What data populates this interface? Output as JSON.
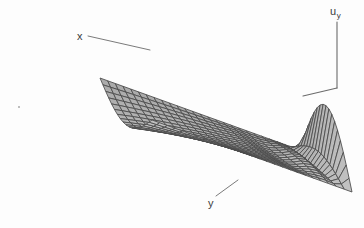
{
  "figure": {
    "kind": "surface-mesh-plot",
    "caption_labels": {
      "x_axis": "x",
      "y_axis": "y",
      "vertical_axis_base": "u",
      "vertical_axis_sub": "y"
    },
    "background_color": "#fdfdfd",
    "mesh_line_color": "#4a4a4a",
    "surface_fill_light": "#c2c2c2",
    "surface_fill_dark": "#8f8f8f",
    "axis_line_color": "#6b6b6b",
    "label_color": "#3b3b3b"
  },
  "chart_data": {
    "type": "surface",
    "title": "",
    "xlabel": "x",
    "ylabel": "y",
    "zlabel": "u_y",
    "grid": true,
    "legend": "none",
    "nx": 26,
    "ny": 18,
    "xlim": [
      0,
      1
    ],
    "ylim": [
      0,
      1
    ],
    "zlim": [
      0,
      1
    ],
    "projection": {
      "origin_px": [
        300,
        150
      ],
      "x_axis_px": [
        -200,
        -72
      ],
      "y_axis_px": [
        52,
        42
      ],
      "z_axis_px": [
        0,
        -86
      ]
    },
    "surface_model": {
      "base_dip_amplitude": 0.3,
      "ripple_amplitude": 0.16,
      "ripple_frequency": 7.5,
      "ripple_growth_power": 6.0,
      "spike_amplitude": 0.92,
      "spike_width": 0.035,
      "spike_x_location": 1.0
    },
    "axis_lines": [
      {
        "name": "vertical-axis",
        "from_px": [
          337,
          22
        ],
        "to_px": [
          337,
          88
        ]
      },
      {
        "name": "back-edge-axis",
        "from_px": [
          337,
          88
        ],
        "to_px": [
          303,
          96
        ]
      }
    ],
    "leader_lines": [
      {
        "name": "x-leader",
        "from_px": [
          88,
          36
        ],
        "to_px": [
          150,
          50
        ]
      },
      {
        "name": "y-leader",
        "from_px": [
          216,
          196
        ],
        "to_px": [
          238,
          180
        ]
      }
    ]
  }
}
